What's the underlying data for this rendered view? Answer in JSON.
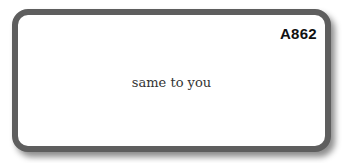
{
  "card": {
    "code": "A862",
    "phrase": "same to you"
  },
  "colors": {
    "border": "#5e5e5e",
    "background": "#ffffff",
    "text": "#333333"
  }
}
